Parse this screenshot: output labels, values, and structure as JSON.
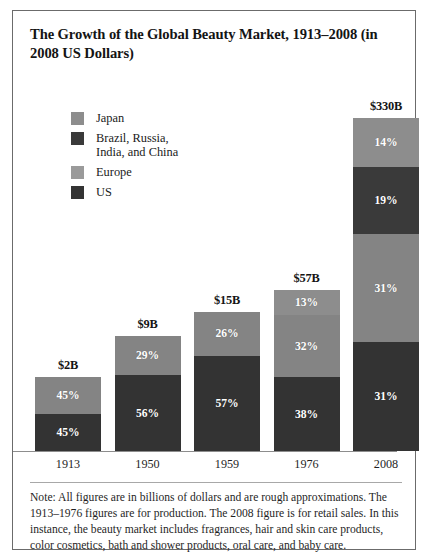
{
  "figure": {
    "title": "The Growth of the Global Beauty Market, 1913–2008 (in 2008 US Dollars)",
    "note": "Note: All figures are in billions of dollars and are rough approximations. The 1913–1976 figures are for production. The 2008 figure is for retail sales. In this instance, the beauty market includes fragrances, hair and skin care products, color cosmetics, bath and shower products, oral care, and baby care."
  },
  "colors": {
    "japan": "#8d8d8d",
    "bric": "#3a3a3a",
    "europe": "#848484",
    "us": "#333333",
    "frame": "#6b6b6b",
    "axis": "#8d8d8d"
  },
  "legend": {
    "items": [
      {
        "label": "Japan",
        "color": "#8d8d8d",
        "key": "japan"
      },
      {
        "label": "Brazil, Russia,\nIndia, and China",
        "color": "#3a3a3a",
        "key": "bric"
      },
      {
        "label": "Europe",
        "color": "#9a9a9a",
        "key": "europe"
      },
      {
        "label": "US",
        "color": "#333333",
        "key": "us"
      }
    ]
  },
  "chart_data": {
    "type": "bar",
    "title": "The Growth of the Global Beauty Market, 1913–2008 (in 2008 US Dollars)",
    "xlabel": "",
    "ylabel": "",
    "stacked": true,
    "grid": false,
    "legend_position": "top-left",
    "categories": [
      "1913",
      "1950",
      "1959",
      "1976",
      "2008"
    ],
    "totals_billions": [
      2,
      9,
      15,
      57,
      330
    ],
    "total_labels": [
      "$2B",
      "$9B",
      "$15B",
      "$57B",
      "$330B"
    ],
    "series": [
      {
        "name": "Japan",
        "key": "japan",
        "values": [
          null,
          null,
          null,
          13,
          14
        ]
      },
      {
        "name": "Brazil, Russia, India, and China",
        "key": "bric",
        "values": [
          null,
          null,
          null,
          null,
          19
        ]
      },
      {
        "name": "Europe",
        "key": "europe",
        "values": [
          45,
          29,
          26,
          32,
          31
        ]
      },
      {
        "name": "US",
        "key": "us",
        "values": [
          45,
          56,
          57,
          38,
          31
        ]
      }
    ],
    "bars": [
      {
        "category": "1913",
        "total_label": "$2B",
        "pixel_height": 74,
        "segments": [
          {
            "key": "europe",
            "label": "45%",
            "value": 45,
            "frac": 0.5
          },
          {
            "key": "us",
            "label": "45%",
            "value": 45,
            "frac": 0.5
          }
        ]
      },
      {
        "category": "1950",
        "total_label": "$9B",
        "pixel_height": 115,
        "segments": [
          {
            "key": "europe",
            "label": "29%",
            "value": 29,
            "frac": 0.341
          },
          {
            "key": "us",
            "label": "56%",
            "value": 56,
            "frac": 0.659
          }
        ]
      },
      {
        "category": "1959",
        "total_label": "$15B",
        "pixel_height": 139,
        "segments": [
          {
            "key": "europe",
            "label": "26%",
            "value": 26,
            "frac": 0.313
          },
          {
            "key": "us",
            "label": "57%",
            "value": 57,
            "frac": 0.687
          }
        ]
      },
      {
        "category": "1976",
        "total_label": "$57B",
        "pixel_height": 161,
        "segments": [
          {
            "key": "japan",
            "label": "13%",
            "value": 13,
            "frac": 0.157
          },
          {
            "key": "europe",
            "label": "32%",
            "value": 32,
            "frac": 0.386
          },
          {
            "key": "us",
            "label": "38%",
            "value": 38,
            "frac": 0.457
          }
        ]
      },
      {
        "category": "2008",
        "total_label": "$330B",
        "pixel_height": 335,
        "segments": [
          {
            "key": "japan",
            "label": "14%",
            "value": 14,
            "frac": 0.148
          },
          {
            "key": "bric",
            "label": "19%",
            "value": 19,
            "frac": 0.2
          },
          {
            "key": "europe",
            "label": "31%",
            "value": 31,
            "frac": 0.326
          },
          {
            "key": "us",
            "label": "31%",
            "value": 31,
            "frac": 0.326
          }
        ]
      }
    ]
  }
}
